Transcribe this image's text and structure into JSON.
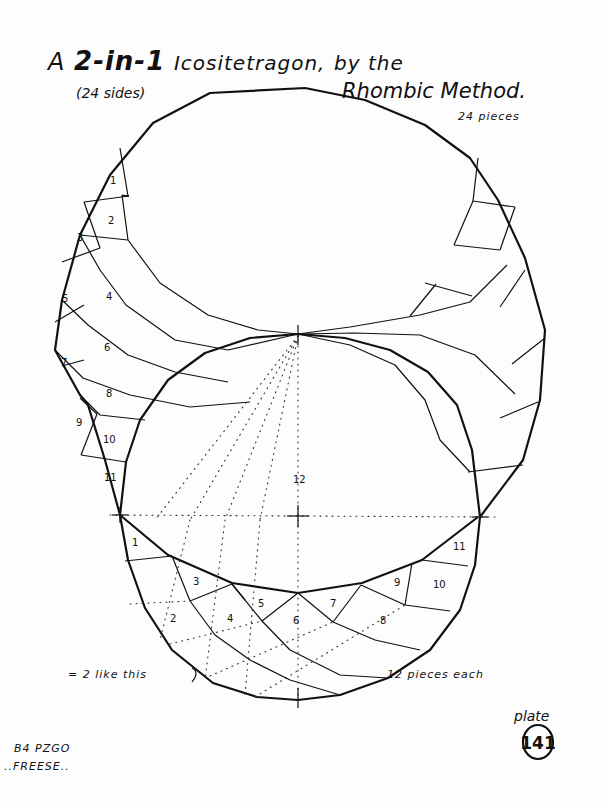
{
  "title": {
    "prefix": "A",
    "emph": "2-in-1",
    "main": "Icositetragon,",
    "suffix": "by the",
    "sides_note": "(24 sides)",
    "method": "Rhombic Method."
  },
  "labels": {
    "upper_pieces": "24 pieces",
    "equals_note": "= 2 like this",
    "lower_pieces": "12 pieces each",
    "plate_label": "plate",
    "plate_number": "141",
    "author_line1": "B4 PZGO",
    "author_line2": "..FREESE.."
  },
  "upper_piece_numbers": [
    "1",
    "2",
    "3",
    "4",
    "5",
    "6",
    "7",
    "8",
    "9",
    "10",
    "11"
  ],
  "center_piece_number": "12",
  "lower_piece_numbers": [
    "1",
    "2",
    "3",
    "4",
    "5",
    "6",
    "7",
    "8",
    "9",
    "10",
    "11"
  ]
}
